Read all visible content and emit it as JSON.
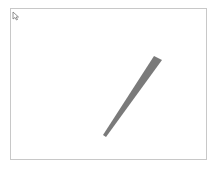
{
  "canvas": {
    "border_color": "#c8c8c8",
    "background": "#ffffff"
  },
  "cursor": {
    "icon": "arrow-cursor-icon"
  },
  "shape": {
    "type": "tapered-stroke",
    "fill": "#7a7a7a",
    "points": "154,56 162,60 106,137 103,135"
  }
}
